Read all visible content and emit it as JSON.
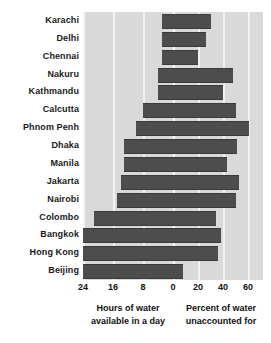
{
  "chart_data": {
    "type": "bar",
    "subtype": "diverging-horizontal-butterfly",
    "title": "",
    "categories": [
      "Karachi",
      "Delhi",
      "Chennai",
      "Nakuru",
      "Kathmandu",
      "Calcutta",
      "Phnom Penh",
      "Dhaka",
      "Manila",
      "Jakarta",
      "Nairobi",
      "Colombo",
      "Bangkok",
      "Hong Kong",
      "Beijing"
    ],
    "series": [
      {
        "name": "Hours of water available in a day",
        "side": "left",
        "axis_label": "Hours of water available in a day",
        "ticks": [
          24,
          16,
          8,
          0
        ],
        "axis_range": [
          0,
          26
        ],
        "direction": "right-to-left",
        "values": [
          3,
          3,
          3,
          4,
          4,
          8,
          10,
          13,
          13,
          14,
          15,
          21,
          24,
          24,
          24
        ]
      },
      {
        "name": "Percent of water unaccounted for",
        "side": "right",
        "axis_label": "Percent of water unaccounted for",
        "ticks": [
          0,
          20,
          40,
          60
        ],
        "axis_range": [
          0,
          70
        ],
        "direction": "left-to-right",
        "values": [
          30,
          26,
          20,
          48,
          40,
          50,
          61,
          51,
          43,
          53,
          50,
          34,
          38,
          36,
          8
        ]
      }
    ],
    "xlabel": "",
    "ylabel": "",
    "grid": true,
    "legend": "none",
    "bar_color": "#4d4d4d",
    "plot_background": "#d9d9d9",
    "gridline_color": "#f2f2f2"
  },
  "axes": {
    "left": {
      "caption_line1": "Hours of water",
      "caption_line2": "available in a day",
      "tick_labels": [
        "24",
        "16",
        "8",
        "0"
      ]
    },
    "right": {
      "caption_line1": "Percent of water",
      "caption_line2": "unaccounted for",
      "tick_labels": [
        "20",
        "40",
        "60"
      ]
    }
  }
}
